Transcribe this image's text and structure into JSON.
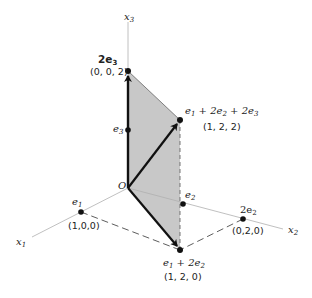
{
  "axes": {
    "x1": {
      "name": "x",
      "sub": "1"
    },
    "x2": {
      "name": "x",
      "sub": "2"
    },
    "x3": {
      "name": "x",
      "sub": "3"
    }
  },
  "origin": {
    "label": "O"
  },
  "points": {
    "e1": {
      "label_main": "e",
      "label_sub": "1",
      "coords": "(1,0,0)"
    },
    "e2": {
      "label_main": "e",
      "label_sub": "2"
    },
    "e3": {
      "label_main": "e",
      "label_sub": "3"
    },
    "two_e2": {
      "label_main": "2e",
      "label_sub": "2",
      "coords": "(0,2,0)"
    },
    "two_e3": {
      "label_main": "2e",
      "label_sub": "3",
      "coords": "(0, 0, 2)"
    },
    "e1_2e2": {
      "p1": "e",
      "s1": "1",
      "p2": " + 2e",
      "s2": "2",
      "coords": "(1, 2, 0)"
    },
    "e1_2e2_2e3": {
      "p1": "e",
      "s1": "1",
      "p2": " + 2e",
      "s2": "2",
      "p3": " + 2e",
      "s3": "3",
      "coords": "(1, 2, 2)"
    }
  },
  "colors": {
    "plane_fill": "#c8c8c8",
    "axis": "#b0b0b0",
    "vector": "#111111"
  }
}
